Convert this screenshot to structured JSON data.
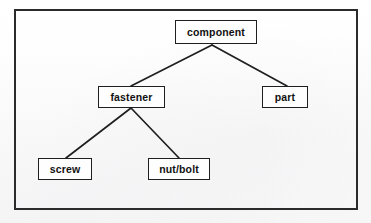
{
  "figure": {
    "kind": "hierarchy-tree-diagram",
    "background_color": "#fdfdfd",
    "frame_color": "#2b2b2b",
    "node_border_color": "#1f1f1f",
    "node_fill_color": "#fefefe",
    "edge_color": "#1f1f1f",
    "text_color": "#111111"
  },
  "nodes": [
    {
      "id": "component",
      "label": "component",
      "x": 175,
      "y": 20,
      "width": 82,
      "height": 24,
      "level": 0
    },
    {
      "id": "fastener",
      "label": "fastener",
      "x": 98,
      "y": 86,
      "width": 67,
      "height": 22,
      "level": 1
    },
    {
      "id": "part",
      "label": "part",
      "x": 262,
      "y": 86,
      "width": 46,
      "height": 22,
      "level": 1
    },
    {
      "id": "screw",
      "label": "screw",
      "x": 38,
      "y": 158,
      "width": 54,
      "height": 22,
      "level": 2
    },
    {
      "id": "nutbolt",
      "label": "nut/bolt",
      "x": 148,
      "y": 158,
      "width": 62,
      "height": 22,
      "level": 2
    }
  ],
  "edges": [
    {
      "id": "component-fastener",
      "from": "component",
      "to": "fastener",
      "x1": 212,
      "y1": 45,
      "x2": 131,
      "y2": 86
    },
    {
      "id": "component-part",
      "from": "component",
      "to": "part",
      "x1": 212,
      "y1": 45,
      "x2": 287,
      "y2": 86
    },
    {
      "id": "fastener-screw",
      "from": "fastener",
      "to": "screw",
      "x1": 131,
      "y1": 108,
      "x2": 66,
      "y2": 158
    },
    {
      "id": "fastener-nutbolt",
      "from": "fastener",
      "to": "nutbolt",
      "x1": 131,
      "y1": 108,
      "x2": 179,
      "y2": 158
    }
  ]
}
